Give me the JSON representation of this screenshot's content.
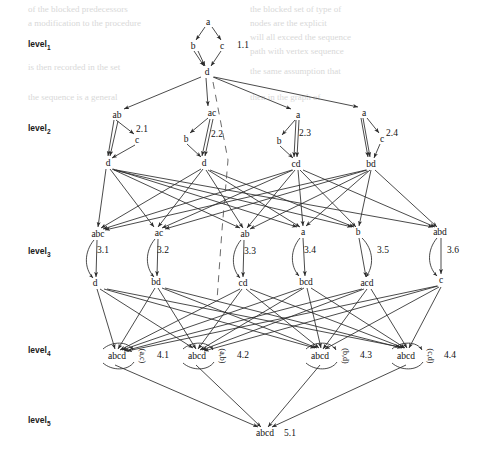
{
  "figure": {
    "type": "diagram",
    "levels": [
      {
        "id": "level1",
        "label": "level",
        "sub": "1",
        "x": 28,
        "y": 45
      },
      {
        "id": "level2",
        "label": "level",
        "sub": "2",
        "x": 28,
        "y": 128
      },
      {
        "id": "level3",
        "label": "level",
        "sub": "3",
        "x": 28,
        "y": 252
      },
      {
        "id": "level4",
        "label": "level",
        "sub": "4",
        "x": 28,
        "y": 350
      },
      {
        "id": "level5",
        "label": "level",
        "sub": "5",
        "x": 28,
        "y": 420
      }
    ],
    "nodes": [
      {
        "id": "n_a_top",
        "text": "a",
        "x": 208,
        "y": 22
      },
      {
        "id": "n_b_1",
        "text": "b",
        "x": 193,
        "y": 46
      },
      {
        "id": "n_c_1",
        "text": "c",
        "x": 222,
        "y": 46
      },
      {
        "id": "n_d_1",
        "text": "d",
        "x": 207,
        "y": 72
      },
      {
        "id": "n_ab_21",
        "text": "ab",
        "x": 117,
        "y": 115
      },
      {
        "id": "n_c_21",
        "text": "c",
        "x": 137,
        "y": 140
      },
      {
        "id": "n_d_21",
        "text": "d",
        "x": 108,
        "y": 163
      },
      {
        "id": "n_ac_22",
        "text": "ac",
        "x": 212,
        "y": 113
      },
      {
        "id": "n_b_22",
        "text": "b",
        "x": 186,
        "y": 139
      },
      {
        "id": "n_d_22",
        "text": "d",
        "x": 204,
        "y": 163
      },
      {
        "id": "n_a_23",
        "text": "a",
        "x": 298,
        "y": 115
      },
      {
        "id": "n_b_23",
        "text": "b",
        "x": 279,
        "y": 141
      },
      {
        "id": "n_cd_23",
        "text": "cd",
        "x": 296,
        "y": 164
      },
      {
        "id": "n_a_24",
        "text": "a",
        "x": 364,
        "y": 113
      },
      {
        "id": "n_c_24",
        "text": "c",
        "x": 382,
        "y": 139
      },
      {
        "id": "n_bd_24",
        "text": "bd",
        "x": 371,
        "y": 164
      },
      {
        "id": "n_abc_31",
        "text": "abc",
        "x": 98,
        "y": 234
      },
      {
        "id": "n_d_31",
        "text": "d",
        "x": 95,
        "y": 283
      },
      {
        "id": "n_ac_32",
        "text": "ac",
        "x": 159,
        "y": 233
      },
      {
        "id": "n_bd_32",
        "text": "bd",
        "x": 156,
        "y": 282
      },
      {
        "id": "n_ab_33",
        "text": "ab",
        "x": 245,
        "y": 234
      },
      {
        "id": "n_cd_33",
        "text": "cd",
        "x": 243,
        "y": 283
      },
      {
        "id": "n_a_34",
        "text": "a",
        "x": 303,
        "y": 232
      },
      {
        "id": "n_bcd_34",
        "text": "bcd",
        "x": 306,
        "y": 282
      },
      {
        "id": "n_b_35",
        "text": "b",
        "x": 358,
        "y": 232
      },
      {
        "id": "n_acd_35",
        "text": "acd",
        "x": 367,
        "y": 283
      },
      {
        "id": "n_abd_36",
        "text": "abd",
        "x": 440,
        "y": 232
      },
      {
        "id": "n_c_36",
        "text": "c",
        "x": 441,
        "y": 280
      },
      {
        "id": "n_abcd_41",
        "text": "abcd",
        "x": 117,
        "y": 356
      },
      {
        "id": "n_abcd_42",
        "text": "abcd",
        "x": 197,
        "y": 356
      },
      {
        "id": "n_abcd_43",
        "text": "abcd",
        "x": 320,
        "y": 356
      },
      {
        "id": "n_abcd_44",
        "text": "abcd",
        "x": 406,
        "y": 356
      },
      {
        "id": "n_abcd_51",
        "text": "abcd",
        "x": 265,
        "y": 433
      }
    ],
    "cluster_labels": [
      {
        "id": "c11",
        "text": "1.1",
        "x": 243,
        "y": 45
      },
      {
        "id": "c21",
        "text": "2.1",
        "x": 142,
        "y": 129
      },
      {
        "id": "c22",
        "text": "2.2",
        "x": 217,
        "y": 134
      },
      {
        "id": "c23",
        "text": "2.3",
        "x": 305,
        "y": 133
      },
      {
        "id": "c24",
        "text": "2.4",
        "x": 392,
        "y": 133
      },
      {
        "id": "c31",
        "text": "3.1",
        "x": 103,
        "y": 250
      },
      {
        "id": "c32",
        "text": "3.2",
        "x": 163,
        "y": 250
      },
      {
        "id": "c33",
        "text": "3.3",
        "x": 250,
        "y": 251
      },
      {
        "id": "c34",
        "text": "3.4",
        "x": 310,
        "y": 250
      },
      {
        "id": "c35",
        "text": "3.5",
        "x": 383,
        "y": 250
      },
      {
        "id": "c36",
        "text": "3.6",
        "x": 453,
        "y": 250
      },
      {
        "id": "c41",
        "text": "4.1",
        "x": 163,
        "y": 355
      },
      {
        "id": "c42",
        "text": "4.2",
        "x": 243,
        "y": 355
      },
      {
        "id": "c43",
        "text": "4.3",
        "x": 366,
        "y": 355
      },
      {
        "id": "c44",
        "text": "4.4",
        "x": 450,
        "y": 355
      },
      {
        "id": "c51",
        "text": "5.1",
        "x": 290,
        "y": 433
      }
    ],
    "pair_labels": [
      {
        "id": "p41",
        "text": "(a,c)",
        "x": 142,
        "y": 356
      },
      {
        "id": "p42",
        "text": "(a,b)",
        "x": 222,
        "y": 356
      },
      {
        "id": "p43",
        "text": "(b,d)",
        "x": 345,
        "y": 356
      },
      {
        "id": "p44",
        "text": "(c,d)",
        "x": 430,
        "y": 356
      }
    ],
    "background_text": {
      "note": "faint scanned book text bleeding through behind the figure",
      "lines": [
        {
          "text": "of the blocked predecessors",
          "x": 30,
          "y": 10
        },
        {
          "text": "the blocked set of type of",
          "x": 252,
          "y": 10
        },
        {
          "text": "a modification to the procedure",
          "x": 30,
          "y": 24
        },
        {
          "text": "nodes are the explicit",
          "x": 252,
          "y": 24
        },
        {
          "text": "will all exceed the sequence",
          "x": 252,
          "y": 38
        },
        {
          "text": "each vertex in the graph",
          "x": 252,
          "y": 38
        },
        {
          "text": "path with vertex sequence",
          "x": 252,
          "y": 55
        },
        {
          "text": "is then recorded in the set",
          "x": 30,
          "y": 68
        },
        {
          "text": "the same assumption that",
          "x": 252,
          "y": 72
        },
        {
          "text": "the sequence is a general",
          "x": 30,
          "y": 96
        },
        {
          "text": "then in the graph of",
          "x": 252,
          "y": 96
        }
      ]
    }
  },
  "graph_edges": {
    "solid_color": "#2b2b2b",
    "dashed_color": "#555555",
    "description": "directed edges of the refinement lattice"
  }
}
